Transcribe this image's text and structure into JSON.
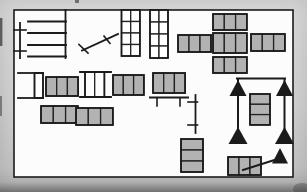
{
  "figure": {
    "canvas": {
      "w": 307,
      "h": 192
    },
    "palette": {
      "outer_bg": "#cfcfcf",
      "inner_bg": "#fcfcfc",
      "ink": "#1b1b1b",
      "cell_fill": "#b2b2b2",
      "cell_edge": "#232323",
      "white_cell": "#ffffff"
    },
    "frame": {
      "x": 14,
      "y": 10,
      "w": 279,
      "h": 167,
      "stroke_w": 1.6
    },
    "gray_blocks": [
      {
        "id": "cluster-top-block",
        "x": 213,
        "y": 14,
        "cols": 3,
        "rows": 1,
        "cw": 11.3,
        "ch": 16
      },
      {
        "id": "cluster-left-block",
        "x": 178,
        "y": 35,
        "cols": 3,
        "rows": 1,
        "cw": 11.0,
        "ch": 17
      },
      {
        "id": "cluster-center-block",
        "x": 213,
        "y": 33,
        "cols": 3,
        "rows": 1,
        "cw": 11.3,
        "ch": 20
      },
      {
        "id": "cluster-right-block",
        "x": 251,
        "y": 34,
        "cols": 3,
        "rows": 1,
        "cw": 11.3,
        "ch": 17
      },
      {
        "id": "cluster-bottom-block",
        "x": 213,
        "y": 57,
        "cols": 3,
        "rows": 1,
        "cw": 11.3,
        "ch": 16
      },
      {
        "id": "midrow-block-a",
        "x": 46,
        "y": 77,
        "cols": 3,
        "rows": 1,
        "cw": 10.7,
        "ch": 19
      },
      {
        "id": "midrow-block-b",
        "x": 113,
        "y": 75,
        "cols": 3,
        "rows": 1,
        "cw": 10.3,
        "ch": 20
      },
      {
        "id": "midrow-block-c",
        "x": 153,
        "y": 73,
        "cols": 3,
        "rows": 1,
        "cw": 10.7,
        "ch": 20
      },
      {
        "id": "longrow-left-block",
        "x": 41,
        "y": 106,
        "cols": 3,
        "rows": 1,
        "cw": 12.3,
        "ch": 17
      },
      {
        "id": "longrow-right-block",
        "x": 76,
        "y": 108,
        "cols": 3,
        "rows": 1,
        "cw": 12.3,
        "ch": 17
      },
      {
        "id": "goal-middle-stack",
        "x": 250,
        "y": 94,
        "cols": 1,
        "rows": 3,
        "cw": 20,
        "ch": 10.3
      },
      {
        "id": "center-bottom-stack",
        "x": 181,
        "y": 139,
        "cols": 1,
        "rows": 3,
        "cw": 22,
        "ch": 11
      },
      {
        "id": "arrow-target-block",
        "x": 228,
        "y": 157,
        "cols": 3,
        "rows": 1,
        "cw": 11.0,
        "ch": 18
      }
    ],
    "white_grids": [
      {
        "id": "top-grid-a",
        "x": 121.5,
        "y": 10,
        "cols": 2,
        "rows": 4,
        "cw": 9.2,
        "ch": 11.5
      },
      {
        "id": "top-grid-b",
        "x": 150,
        "y": 10,
        "cols": 2,
        "rows": 4,
        "cw": 9.0,
        "ch": 12
      },
      {
        "id": "bracket-box",
        "x": 34.5,
        "y": 73,
        "cols": 1,
        "rows": 1,
        "cw": 8.5,
        "ch": 25
      },
      {
        "id": "double-white-box",
        "x": 85,
        "y": 72,
        "cols": 2,
        "rows": 1,
        "cw": 9.7,
        "ch": 25
      }
    ],
    "lines": [
      {
        "id": "comb-right-rail",
        "x1": 65.5,
        "y1": 10,
        "x2": 65.5,
        "y2": 58,
        "w": 1.8
      },
      {
        "id": "comb-rung-1",
        "x1": 28,
        "y1": 21.5,
        "x2": 66,
        "y2": 21.5,
        "w": 1.8
      },
      {
        "id": "comb-rung-2",
        "x1": 28,
        "y1": 33,
        "x2": 66,
        "y2": 33,
        "w": 1.8
      },
      {
        "id": "comb-rung-3",
        "x1": 28,
        "y1": 45,
        "x2": 66,
        "y2": 45,
        "w": 1.8
      },
      {
        "id": "comb-rung-4",
        "x1": 28,
        "y1": 56.5,
        "x2": 66,
        "y2": 56.5,
        "w": 1.8
      },
      {
        "id": "comb-left-rail",
        "x1": 20,
        "y1": 23,
        "x2": 20,
        "y2": 58,
        "w": 1.8
      },
      {
        "id": "comb-left-tick-1",
        "x1": 14,
        "y1": 30,
        "x2": 26,
        "y2": 30,
        "w": 1.6
      },
      {
        "id": "comb-left-tick-2",
        "x1": 14,
        "y1": 51,
        "x2": 26,
        "y2": 51,
        "w": 1.6
      },
      {
        "id": "rake-handle",
        "x1": 82,
        "y1": 50.5,
        "x2": 118,
        "y2": 34,
        "w": 1.8
      },
      {
        "id": "rake-head",
        "x1": 79,
        "y1": 44.5,
        "x2": 88,
        "y2": 53,
        "w": 1.6
      },
      {
        "id": "rake-tick",
        "x1": 104,
        "y1": 36,
        "x2": 110,
        "y2": 43.5,
        "w": 1.6
      },
      {
        "id": "bracket-top-edge",
        "x1": 18,
        "y1": 73,
        "x2": 43,
        "y2": 73,
        "w": 1.8
      },
      {
        "id": "bracket-bottom-edge",
        "x1": 18,
        "y1": 98,
        "x2": 43,
        "y2": 98,
        "w": 1.8
      },
      {
        "id": "doublebox-top-edge",
        "x1": 80,
        "y1": 72,
        "x2": 111,
        "y2": 72,
        "w": 1.8
      },
      {
        "id": "doublebox-bottom-edge",
        "x1": 80,
        "y1": 97,
        "x2": 111,
        "y2": 97,
        "w": 1.8
      },
      {
        "id": "h-bench-top",
        "x1": 150,
        "y1": 97.5,
        "x2": 188,
        "y2": 97.5,
        "w": 2
      },
      {
        "id": "h-bench-leg-1",
        "x1": 157,
        "y1": 98,
        "x2": 157,
        "y2": 106,
        "w": 1.6
      },
      {
        "id": "h-bench-leg-2",
        "x1": 180,
        "y1": 98,
        "x2": 180,
        "y2": 106,
        "w": 1.6
      },
      {
        "id": "v-bench-rail",
        "x1": 195.5,
        "y1": 95,
        "x2": 195.5,
        "y2": 133,
        "w": 1.8
      },
      {
        "id": "v-bench-tick-1",
        "x1": 188,
        "y1": 102,
        "x2": 197.5,
        "y2": 102,
        "w": 1.6
      },
      {
        "id": "v-bench-tick-2",
        "x1": 188,
        "y1": 125,
        "x2": 197.5,
        "y2": 125,
        "w": 1.6
      },
      {
        "id": "goal-top-bar",
        "x1": 237,
        "y1": 78.5,
        "x2": 285,
        "y2": 78.5,
        "w": 2
      },
      {
        "id": "goal-left-pole",
        "x1": 238,
        "y1": 79,
        "x2": 238,
        "y2": 135,
        "w": 2
      },
      {
        "id": "goal-right-pole",
        "x1": 284.5,
        "y1": 79,
        "x2": 284.5,
        "y2": 135,
        "w": 2
      },
      {
        "id": "arrow-shaft",
        "x1": 243,
        "y1": 170,
        "x2": 279,
        "y2": 158.5,
        "w": 2
      }
    ],
    "triangles": [
      {
        "id": "goal-top-left-triangle",
        "cx": 238,
        "apex_y": 80,
        "base_y": 96,
        "hw": 8.5
      },
      {
        "id": "goal-top-right-triangle",
        "cx": 284.5,
        "apex_y": 80,
        "base_y": 96,
        "hw": 8.5
      },
      {
        "id": "goal-bottom-left-triangle",
        "cx": 238,
        "apex_y": 127,
        "base_y": 144,
        "hw": 9.5
      },
      {
        "id": "goal-bottom-right-triangle",
        "cx": 284.5,
        "apex_y": 127,
        "base_y": 144,
        "hw": 9.5
      },
      {
        "id": "arrow-head-triangle",
        "cx": 280,
        "apex_y": 148,
        "base_y": 163.5,
        "hw": 8
      }
    ],
    "artifacts": [
      {
        "id": "top-edge-mark",
        "type": "rect",
        "x": 75,
        "y": 0,
        "w": 4,
        "h": 3,
        "fill": "#555555",
        "opacity": 0.8
      },
      {
        "id": "left-edge-mark-1",
        "type": "rect",
        "x": 0,
        "y": 18,
        "w": 2.4,
        "h": 28,
        "fill": "#3a3a3a",
        "opacity": 0.75
      },
      {
        "id": "left-edge-mark-2",
        "type": "rect",
        "x": 0,
        "y": 96,
        "w": 2,
        "h": 20,
        "fill": "#4a4a4a",
        "opacity": 0.6
      },
      {
        "id": "corner-smudge",
        "type": "ellipse",
        "cx": 302,
        "cy": 189,
        "rx": 9,
        "ry": 6,
        "fill": "#6f6f6f",
        "opacity": 0.65
      }
    ]
  }
}
